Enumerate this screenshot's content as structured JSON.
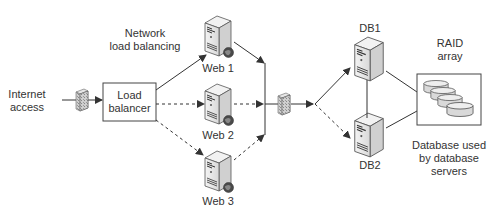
{
  "diagram": {
    "type": "network-architecture",
    "labels": {
      "internet": "Internet access",
      "internet_line1": "Internet",
      "internet_line2": "access",
      "network_lb_line1": "Network",
      "network_lb_line2": "load balancing",
      "load_balancer_line1": "Load",
      "load_balancer_line2": "balancer",
      "web1": "Web 1",
      "web2": "Web 2",
      "web3": "Web 3",
      "db1": "DB1",
      "db2": "DB2",
      "raid_line1": "RAID",
      "raid_line2": "array",
      "db_used_line1": "Database used",
      "db_used_line2": "by database",
      "db_used_line3": "servers"
    },
    "nodes": [
      {
        "id": "internet",
        "label": "Internet access",
        "kind": "text"
      },
      {
        "id": "firewall1",
        "label": "",
        "kind": "firewall-icon"
      },
      {
        "id": "load_balancer",
        "label": "Load balancer",
        "kind": "box"
      },
      {
        "id": "web1",
        "label": "Web 1",
        "kind": "web-server-icon"
      },
      {
        "id": "web2",
        "label": "Web 2",
        "kind": "web-server-icon"
      },
      {
        "id": "web3",
        "label": "Web 3",
        "kind": "web-server-icon"
      },
      {
        "id": "firewall2",
        "label": "",
        "kind": "firewall-icon"
      },
      {
        "id": "db1",
        "label": "DB1",
        "kind": "server-icon"
      },
      {
        "id": "db2",
        "label": "DB2",
        "kind": "server-icon"
      },
      {
        "id": "raid",
        "label": "RAID array",
        "kind": "disk-array-box"
      }
    ],
    "edges": [
      {
        "from": "internet",
        "to": "firewall1",
        "style": "solid"
      },
      {
        "from": "firewall1",
        "to": "load_balancer",
        "style": "solid-arrow"
      },
      {
        "from": "load_balancer",
        "to": "web1",
        "style": "solid-arrow"
      },
      {
        "from": "load_balancer",
        "to": "web2",
        "style": "dashed-arrow"
      },
      {
        "from": "load_balancer",
        "to": "web3",
        "style": "dashed-arrow"
      },
      {
        "from": "web1",
        "to": "bus",
        "style": "solid-arrow"
      },
      {
        "from": "web2",
        "to": "bus",
        "style": "dashed-arrow"
      },
      {
        "from": "web3",
        "to": "bus",
        "style": "dashed-arrow"
      },
      {
        "from": "bus",
        "to": "firewall2",
        "style": "solid"
      },
      {
        "from": "firewall2",
        "to": "junction",
        "style": "solid-arrow"
      },
      {
        "from": "junction",
        "to": "db1",
        "style": "solid-arrow"
      },
      {
        "from": "junction",
        "to": "db2",
        "style": "dashed-arrow"
      },
      {
        "from": "db1",
        "to": "db2",
        "style": "solid"
      },
      {
        "from": "db1",
        "to": "raid",
        "style": "solid"
      },
      {
        "from": "db2",
        "to": "raid",
        "style": "solid"
      }
    ],
    "annotations": [
      "Network load balancing",
      "Database used by database servers"
    ],
    "colors": {
      "line": "#333333",
      "server_body": "#e8e8e8",
      "globe": "#555555",
      "firewall": "#bbbbbb"
    }
  }
}
